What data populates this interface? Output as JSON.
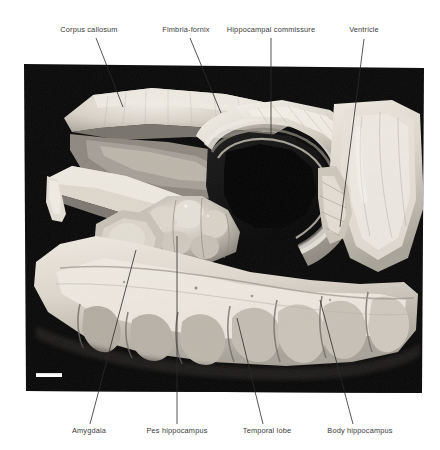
{
  "figure": {
    "kind": "anatomical-photograph",
    "background_color": "#ffffff",
    "photo_background_color": "#0a0a0a",
    "label_color": "#3a3a3a",
    "leader_color": "#2b2b2b",
    "specimen_light": "#e8e4dc",
    "specimen_mid": "#b9b4a9",
    "specimen_dark": "#8d8881"
  },
  "cut_header": {
    "text": "· ·· · ······ ··· ·· ·"
  },
  "scale_bar": {
    "name": "scale-bar",
    "x": 36,
    "y": 373,
    "width": 26,
    "height": 4,
    "color": "#ffffff"
  },
  "photo_frame": {
    "left": 24,
    "top": 62,
    "right": 424,
    "bottom": 393
  },
  "labels": [
    {
      "id": "corpus-callosum",
      "text": "Corpus callosum",
      "x": 89,
      "y": 32,
      "align": "center",
      "leader": {
        "x1": 96,
        "y1": 38,
        "x2": 123,
        "y2": 107
      }
    },
    {
      "id": "fimbria-fornix",
      "text": "Fimbria-fornix",
      "x": 186,
      "y": 32,
      "align": "center",
      "leader": {
        "x1": 190,
        "y1": 38,
        "x2": 221,
        "y2": 113
      }
    },
    {
      "id": "hippocampal-commissure",
      "text": "Hippocampal commissure",
      "x": 271,
      "y": 32,
      "align": "center",
      "leader": {
        "x1": 271,
        "y1": 38,
        "x2": 271,
        "y2": 136
      }
    },
    {
      "id": "ventricle",
      "text": "Ventricle",
      "x": 364,
      "y": 32,
      "align": "center",
      "leader": {
        "x1": 364,
        "y1": 39,
        "x2": 340,
        "y2": 227
      }
    },
    {
      "id": "amygdala",
      "text": "Amygdala",
      "x": 89,
      "y": 431,
      "align": "center",
      "leader": {
        "x1": 90,
        "y1": 424,
        "x2": 136,
        "y2": 250
      }
    },
    {
      "id": "pes-hippocampus",
      "text": "Pes hippocampus",
      "x": 177,
      "y": 431,
      "align": "center",
      "leader": {
        "x1": 177,
        "y1": 424,
        "x2": 177,
        "y2": 236
      }
    },
    {
      "id": "temporal-lobe",
      "text": "Temporal lobe",
      "x": 267,
      "y": 431,
      "align": "center",
      "leader": {
        "x1": 263,
        "y1": 424,
        "x2": 237,
        "y2": 318
      }
    },
    {
      "id": "body-hippocampus",
      "text": "Body hippocampus",
      "x": 360,
      "y": 431,
      "align": "center",
      "leader": {
        "x1": 353,
        "y1": 424,
        "x2": 320,
        "y2": 300
      }
    }
  ]
}
